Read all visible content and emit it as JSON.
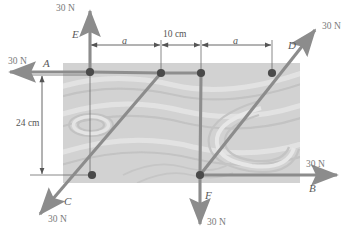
{
  "figure": {
    "plate": {
      "fill": "#cfcfcf",
      "x": 63,
      "y": 63,
      "width": 237,
      "height": 120
    },
    "colors": {
      "force_arrow": "#8c8c8c",
      "dimension_line": "#606060",
      "node_dot": "#4a4a4a",
      "label_text": "#6e6e6e",
      "plate_fill": "#cfcfcf",
      "texture_light": "#e2e2e2",
      "texture_dark": "#bdbdbd",
      "background": "#ffffff"
    },
    "dimensions": [
      {
        "id": "dim-a-left",
        "label": "a",
        "italic": true,
        "x1": 91,
        "x2": 161,
        "y": 45
      },
      {
        "id": "dim-10cm",
        "label": "10 cm",
        "italic": false,
        "x1": 161,
        "x2": 201,
        "y": 45
      },
      {
        "id": "dim-a-right",
        "label": "a",
        "italic": true,
        "x1": 201,
        "x2": 272,
        "y": 45
      },
      {
        "id": "dim-24cm",
        "label": "24 cm",
        "italic": false,
        "y1": 75,
        "y2": 175,
        "x": 42
      }
    ],
    "nodes": [
      {
        "id": "node-e",
        "label": "E",
        "cx": 90,
        "cy": 72
      },
      {
        "id": "node-mid-left",
        "label": "",
        "cx": 161,
        "cy": 73
      },
      {
        "id": "node-mid-right",
        "label": "",
        "cx": 201,
        "cy": 73
      },
      {
        "id": "node-d",
        "label": "D",
        "cx": 272,
        "cy": 73
      },
      {
        "id": "node-c",
        "label": "C",
        "cx": 92,
        "cy": 175
      },
      {
        "id": "node-f",
        "label": "F",
        "cx": 200,
        "cy": 175
      }
    ],
    "forces": [
      {
        "id": "force-a",
        "point": "A",
        "magnitude": "30 N",
        "direction": "left-horizontal",
        "from": {
          "x": 90,
          "y": 72
        },
        "to": {
          "x": 6,
          "y": 72
        },
        "label_pos": {
          "x": 42,
          "y": 57
        },
        "point_label_pos": {
          "x": 44,
          "y": 60
        }
      },
      {
        "id": "force-b",
        "point": "B",
        "magnitude": "30 N",
        "direction": "right-horizontal",
        "from": {
          "x": 200,
          "y": 175
        },
        "to": {
          "x": 341,
          "y": 175
        },
        "label_pos": {
          "x": 312,
          "y": 160
        },
        "point_label_pos": {
          "x": 311,
          "y": 186
        }
      },
      {
        "id": "force-c",
        "point": "C",
        "magnitude": "30 N",
        "direction": "down-left-diagonal",
        "from": {
          "x": 92,
          "y": 175
        },
        "to": {
          "x": 36,
          "y": 218
        },
        "label_pos": {
          "x": 54,
          "y": 222
        },
        "point_label_pos": {
          "x": 66,
          "y": 203
        }
      },
      {
        "id": "force-d",
        "point": "D",
        "magnitude": "30 N",
        "direction": "up-right-diagonal",
        "from": {
          "x": 200,
          "y": 175
        },
        "to": {
          "x": 319,
          "y": 26
        },
        "label_pos": {
          "x": 325,
          "y": 32
        },
        "point_label_pos": {
          "x": 290,
          "y": 47
        }
      },
      {
        "id": "force-e",
        "point": "E",
        "magnitude": "30 N",
        "direction": "up-vertical",
        "from": {
          "x": 90,
          "y": 72
        },
        "to": {
          "x": 90,
          "y": 7
        },
        "label_pos": {
          "x": 56,
          "y": 9
        },
        "point_label_pos": {
          "x": 73,
          "y": 36
        }
      },
      {
        "id": "force-f",
        "point": "F",
        "magnitude": "30 N",
        "direction": "down-vertical",
        "from": {
          "x": 200,
          "y": 175
        },
        "to": {
          "x": 200,
          "y": 228
        },
        "label_pos": {
          "x": 207,
          "y": 224
        },
        "point_label_pos": {
          "x": 206,
          "y": 197
        }
      }
    ],
    "members": [
      {
        "id": "member-c-to-midleft",
        "x1": 92,
        "y1": 175,
        "x2": 161,
        "y2": 73
      },
      {
        "id": "member-midleft-to-midright",
        "x1": 161,
        "y1": 73,
        "x2": 201,
        "y2": 73
      },
      {
        "id": "member-midright-to-f",
        "x1": 201,
        "y1": 73,
        "x2": 200,
        "y2": 175
      },
      {
        "id": "member-a-to-midleft",
        "x1": 90,
        "y1": 72,
        "x2": 161,
        "y2": 73
      }
    ]
  }
}
